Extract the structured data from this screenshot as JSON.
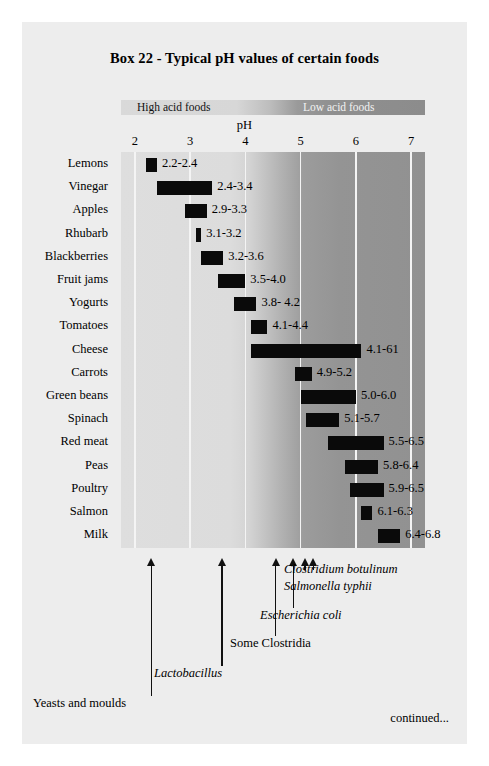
{
  "page": {
    "title": "Box 22 - Typical pH values of certain foods",
    "continued_label": "continued..."
  },
  "band": {
    "high_acid_label": "High acid foods",
    "low_acid_label": "Low acid foods"
  },
  "axis": {
    "title": "pH",
    "ticks": [
      "2",
      "3",
      "4",
      "5",
      "6",
      "7"
    ]
  },
  "annotations": [
    {
      "label": "Yeasts and moulds",
      "italic": false
    },
    {
      "label": "Lactobacillus",
      "italic": true
    },
    {
      "label": "Some Clostridia",
      "italic": false
    },
    {
      "label": "Escherichia coli",
      "italic": true
    },
    {
      "label": "Clostridium botulinum",
      "italic": true
    },
    {
      "label": "Salmonella typhii",
      "italic": true
    }
  ],
  "chart_data": {
    "type": "bar",
    "orientation": "horizontal",
    "title": "Box 22 - Typical pH values of certain foods",
    "xlabel": "pH",
    "ylabel": "",
    "xlim": [
      1.75,
      7.25
    ],
    "grid": true,
    "legend": false,
    "categories": [
      "Lemons",
      "Vinegar",
      "Apples",
      "Rhubarb",
      "Blackberries",
      "Fruit jams",
      "Yogurts",
      "Tomatoes",
      "Cheese",
      "Carrots",
      "Green beans",
      "Spinach",
      "Red meat",
      "Peas",
      "Poultry",
      "Salmon",
      "Milk"
    ],
    "ranges": [
      {
        "food": "Lemons",
        "low": 2.2,
        "high": 2.4,
        "label": "2.2-2.4"
      },
      {
        "food": "Vinegar",
        "low": 2.4,
        "high": 3.4,
        "label": "2.4-3.4"
      },
      {
        "food": "Apples",
        "low": 2.9,
        "high": 3.3,
        "label": "2.9-3.3"
      },
      {
        "food": "Rhubarb",
        "low": 3.1,
        "high": 3.2,
        "label": "3.1-3.2"
      },
      {
        "food": "Blackberries",
        "low": 3.2,
        "high": 3.6,
        "label": "3.2-3.6"
      },
      {
        "food": "Fruit jams",
        "low": 3.5,
        "high": 4.0,
        "label": "3.5-4.0"
      },
      {
        "food": "Yogurts",
        "low": 3.8,
        "high": 4.2,
        "label": "3.8- 4.2"
      },
      {
        "food": "Tomatoes",
        "low": 4.1,
        "high": 4.4,
        "label": "4.1-4.4"
      },
      {
        "food": "Cheese",
        "low": 4.1,
        "high": 6.1,
        "label": "4.1-61"
      },
      {
        "food": "Carrots",
        "low": 4.9,
        "high": 5.2,
        "label": "4.9-5.2"
      },
      {
        "food": "Green beans",
        "low": 5.0,
        "high": 6.0,
        "label": "5.0-6.0"
      },
      {
        "food": "Spinach",
        "low": 5.1,
        "high": 5.7,
        "label": "5.1-5.7"
      },
      {
        "food": "Red meat",
        "low": 5.5,
        "high": 6.5,
        "label": "5.5-6.5"
      },
      {
        "food": "Peas",
        "low": 5.8,
        "high": 6.4,
        "label": "5.8-6.4"
      },
      {
        "food": "Poultry",
        "low": 5.9,
        "high": 6.5,
        "label": "5.9-6.5"
      },
      {
        "food": "Salmon",
        "low": 6.1,
        "high": 6.3,
        "label": "6.1-6.3"
      },
      {
        "food": "Milk",
        "low": 6.4,
        "high": 6.8,
        "label": "6.4-6.8"
      }
    ],
    "organism_markers": [
      {
        "name": "Yeasts and moulds",
        "ph": 2.3
      },
      {
        "name": "Lactobacillus",
        "ph": 3.6
      },
      {
        "name": "Some Clostridia",
        "ph": 4.6
      },
      {
        "name": "Escherichia coli",
        "ph": 4.9
      },
      {
        "name": "Clostridium botulinum",
        "ph": 5.1
      },
      {
        "name": "Salmonella typhii",
        "ph": 5.2
      }
    ]
  }
}
